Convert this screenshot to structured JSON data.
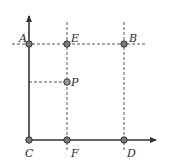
{
  "diagram": {
    "colors": {
      "axis": "#333333",
      "dashed": "#555555",
      "point_fill": "#7a7a7a",
      "point_stroke": "#333333",
      "label": "#2a2a2a"
    },
    "points": [
      {
        "name": "A",
        "x": 29,
        "y": 44
      },
      {
        "name": "E",
        "x": 67,
        "y": 44
      },
      {
        "name": "B",
        "x": 124,
        "y": 44
      },
      {
        "name": "P",
        "x": 67,
        "y": 82
      },
      {
        "name": "C",
        "x": 29,
        "y": 140
      },
      {
        "name": "F",
        "x": 67,
        "y": 140
      },
      {
        "name": "D",
        "x": 124,
        "y": 140
      }
    ],
    "labels": {
      "A": "A",
      "E": "E",
      "B": "B",
      "P": "P",
      "C": "C",
      "F": "F",
      "D": "D"
    }
  }
}
